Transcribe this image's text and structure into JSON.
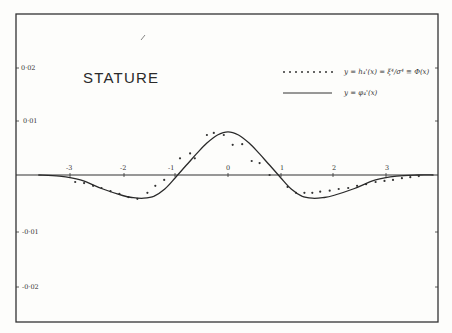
{
  "chart_data": {
    "type": "line",
    "title": "STATURE",
    "xlabel": "",
    "ylabel": "",
    "xlim": [
      -3.6,
      3.9
    ],
    "ylim": [
      -0.027,
      0.03
    ],
    "grid": false,
    "legend_position": "upper right",
    "x_ticks": [
      "-3",
      "-2",
      "-1",
      "0",
      "1",
      "2",
      "3"
    ],
    "y_ticks": [
      "0·02",
      "0·01",
      "-0·01",
      "-0·02"
    ],
    "series": [
      {
        "name": "y = h₄'(x) = ξ⁴/σ⁴ Φ(x)",
        "style": "dotted-points",
        "x": [
          -2.9,
          -2.73,
          -2.56,
          -2.4,
          -2.23,
          -2.06,
          -1.89,
          -1.72,
          -1.53,
          -1.38,
          -1.21,
          -0.91,
          -0.72,
          -0.63,
          -0.4,
          -0.27,
          -0.08,
          0.09,
          0.27,
          0.45,
          0.6,
          0.79,
          1.13,
          1.29,
          1.45,
          1.6,
          1.75,
          1.93,
          2.1,
          2.28,
          2.45,
          2.62,
          2.8,
          2.97,
          3.13,
          3.3,
          3.46,
          3.62
        ],
        "y": [
          -0.0013,
          -0.0015,
          -0.002,
          -0.0024,
          -0.003,
          -0.0035,
          -0.0041,
          -0.0044,
          -0.0033,
          -0.002,
          -0.0009,
          0.0031,
          0.004,
          0.0031,
          0.0074,
          0.0078,
          0.0074,
          0.0056,
          0.0057,
          0.0026,
          0.0022,
          0.0,
          -0.0022,
          -0.0033,
          -0.0033,
          -0.0033,
          -0.0031,
          -0.0029,
          -0.0026,
          -0.0024,
          -0.002,
          -0.0017,
          -0.0013,
          -0.0011,
          -0.0009,
          -0.0006,
          -0.0004,
          -0.0002
        ]
      },
      {
        "name": "y = φ₄'(x)",
        "style": "solid-line",
        "x": [
          -3.6,
          -3.2,
          -2.8,
          -2.4,
          -2.0,
          -1.8,
          -1.6,
          -1.4,
          -1.2,
          -1.0,
          -0.8,
          -0.6,
          -0.4,
          -0.2,
          0.0,
          0.2,
          0.4,
          0.6,
          0.8,
          1.0,
          1.2,
          1.4,
          1.6,
          1.8,
          2.0,
          2.4,
          2.8,
          3.2,
          3.6,
          3.9
        ],
        "y": [
          0.0,
          -0.0002,
          -0.0009,
          -0.0025,
          -0.0038,
          -0.0042,
          -0.0043,
          -0.0039,
          -0.0026,
          -0.0005,
          0.0017,
          0.0039,
          0.0059,
          0.0074,
          0.008,
          0.0074,
          0.0059,
          0.0039,
          0.0017,
          -0.0005,
          -0.0026,
          -0.0039,
          -0.0043,
          -0.0042,
          -0.0038,
          -0.0025,
          -0.0009,
          -0.0002,
          0.0,
          0.0
        ]
      }
    ]
  },
  "labels": {
    "title": "STATURE",
    "legend_dotted": "y = h₄'(x) = ξ⁴/σ⁴ ≡ Φ(x)",
    "legend_solid": "y = φ₄'(x)",
    "y_tick_0": "0·02",
    "y_tick_1": "0·01",
    "y_tick_2": "-0·01",
    "y_tick_3": "-0·02",
    "x_tick_0": "-3",
    "x_tick_1": "-2",
    "x_tick_2": "-1",
    "x_tick_3": "0",
    "x_tick_4": "1",
    "x_tick_5": "2",
    "x_tick_6": "3"
  }
}
